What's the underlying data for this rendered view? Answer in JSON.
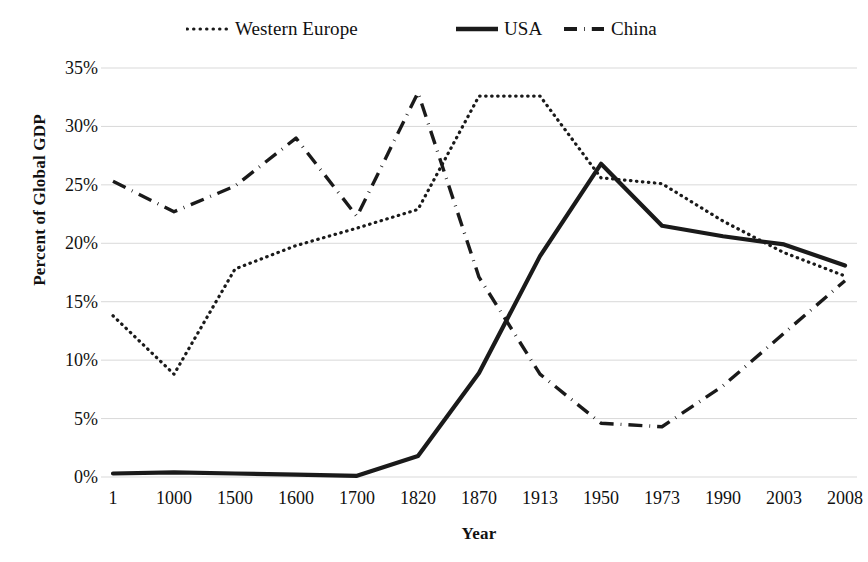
{
  "chart_data": {
    "type": "line",
    "title": "",
    "xlabel": "Year",
    "ylabel": "Percent of Global GDP",
    "categories": [
      "1",
      "1000",
      "1500",
      "1600",
      "1700",
      "1820",
      "1870",
      "1913",
      "1950",
      "1973",
      "1990",
      "2003",
      "2008"
    ],
    "ytick_labels": [
      "0%",
      "5%",
      "10%",
      "15%",
      "20%",
      "25%",
      "30%",
      "35%"
    ],
    "ytick_values": [
      0,
      5,
      10,
      15,
      20,
      25,
      30,
      35
    ],
    "ylim": [
      0,
      35
    ],
    "grid": "horizontal",
    "legend_position": "top",
    "series": [
      {
        "name": "Western Europe",
        "style": "dotted",
        "color": "#1a1a1a",
        "values": [
          13.8,
          8.8,
          17.8,
          19.8,
          21.3,
          22.9,
          32.6,
          32.6,
          25.6,
          25.1,
          21.9,
          19.2,
          17.2
        ]
      },
      {
        "name": "USA",
        "style": "solid",
        "color": "#1a1a1a",
        "values": [
          0.3,
          0.4,
          0.3,
          0.2,
          0.1,
          1.8,
          8.9,
          18.9,
          26.8,
          21.5,
          20.6,
          19.9,
          18.1
        ]
      },
      {
        "name": "China",
        "style": "dash-dot",
        "color": "#1a1a1a",
        "values": [
          25.3,
          22.7,
          24.9,
          29.0,
          22.3,
          32.9,
          17.1,
          8.8,
          4.6,
          4.3,
          7.8,
          12.3,
          16.8
        ]
      }
    ]
  },
  "legend": {
    "items": [
      {
        "label": "Western Europe",
        "style": "dotted"
      },
      {
        "label": "USA",
        "style": "solid"
      },
      {
        "label": "China",
        "style": "dash-dot"
      }
    ]
  },
  "axes": {
    "y_title": "Percent of Global GDP",
    "x_title": "Year"
  }
}
